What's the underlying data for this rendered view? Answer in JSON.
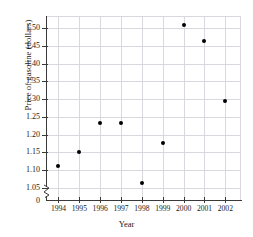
{
  "chart_data": {
    "type": "scatter",
    "title": "",
    "xlabel": "Year",
    "ylabel": "Price of gasoline (dollars)",
    "x": [
      1994,
      1995,
      1996,
      1997,
      1998,
      1999,
      2000,
      2001,
      2002
    ],
    "values": [
      1.11,
      1.152,
      1.232,
      1.232,
      1.062,
      1.175,
      1.51,
      1.465,
      1.295
    ],
    "categories": [
      "1994",
      "1995",
      "1996",
      "1997",
      "1998",
      "1999",
      "2000",
      "2001",
      "2002"
    ],
    "xtick_labels": [
      "1994",
      "1995",
      "1996",
      "1997",
      "1998",
      "1999",
      "2000",
      "2001",
      "2002"
    ],
    "ytick_labels": [
      "0",
      "1.05",
      "1.10",
      "1.15",
      "1.20",
      "1.25",
      "1.30",
      "1.35",
      "1.40",
      "1.45",
      "1.50"
    ],
    "ytick_values": [
      0,
      1.05,
      1.1,
      1.15,
      1.2,
      1.25,
      1.3,
      1.35,
      1.4,
      1.45,
      1.5
    ],
    "ylim": [
      1.015,
      1.535
    ],
    "xlim": [
      1993.45,
      2002.75
    ],
    "grid": true,
    "legend": null,
    "axis_break": true,
    "axis_break_note": "y-axis broken between 0 and 1.05",
    "marker_color": "#000000",
    "grid_color": "#d8d8de",
    "axis_color": "#3a3a3a",
    "series": [
      {
        "name": "Price of gasoline",
        "points": [
          {
            "x": "1994",
            "y": 1.11
          },
          {
            "x": "1995",
            "y": 1.152
          },
          {
            "x": "1996",
            "y": 1.232
          },
          {
            "x": "1997",
            "y": 1.232
          },
          {
            "x": "1998",
            "y": 1.062
          },
          {
            "x": "1999",
            "y": 1.175
          },
          {
            "x": "2000",
            "y": 1.51
          },
          {
            "x": "2001",
            "y": 1.465
          },
          {
            "x": "2002",
            "y": 1.295
          }
        ]
      }
    ]
  }
}
